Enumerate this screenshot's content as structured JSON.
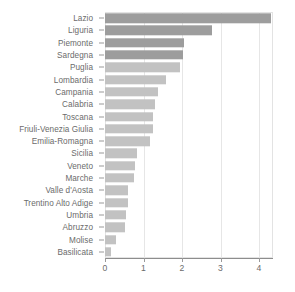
{
  "chart_data": {
    "type": "bar",
    "orientation": "horizontal",
    "title": "",
    "xlabel": "",
    "ylabel": "",
    "xlim": [
      0,
      4.36
    ],
    "xticks": [
      0,
      1,
      2,
      3,
      4
    ],
    "xtick_labels": [
      "0",
      "1",
      "2",
      "3",
      "4"
    ],
    "grid": true,
    "legend": false,
    "categories": [
      "Lazio",
      "Liguria",
      "Piemonte",
      "Sardegna",
      "Puglia",
      "Lombardia",
      "Campania",
      "Calabria",
      "Toscana",
      "Friuli-Venezia Giulia",
      "Emilia-Romagna",
      "Sicilia",
      "Veneto",
      "Marche",
      "Valle d'Aosta",
      "Trentino Alto Adige",
      "Umbria",
      "Abruzzo",
      "Molise",
      "Basilicata"
    ],
    "values": [
      4.31,
      2.78,
      2.04,
      2.02,
      1.95,
      1.58,
      1.38,
      1.3,
      1.25,
      1.24,
      1.17,
      0.83,
      0.78,
      0.75,
      0.6,
      0.6,
      0.55,
      0.52,
      0.29,
      0.16
    ],
    "bar_shades": [
      "dark",
      "dark",
      "dark",
      "dark",
      "light",
      "light",
      "light",
      "light",
      "light",
      "light",
      "light",
      "light",
      "light",
      "light",
      "light",
      "light",
      "light",
      "light",
      "light",
      "light"
    ],
    "colors": {
      "bar_dark": "#9d9d9d",
      "bar_light": "#c2c2c2",
      "gridline": "#e6e6e6",
      "axis": "#8d8d8d",
      "text": "#6b6b6b",
      "background": "#ffffff"
    }
  }
}
